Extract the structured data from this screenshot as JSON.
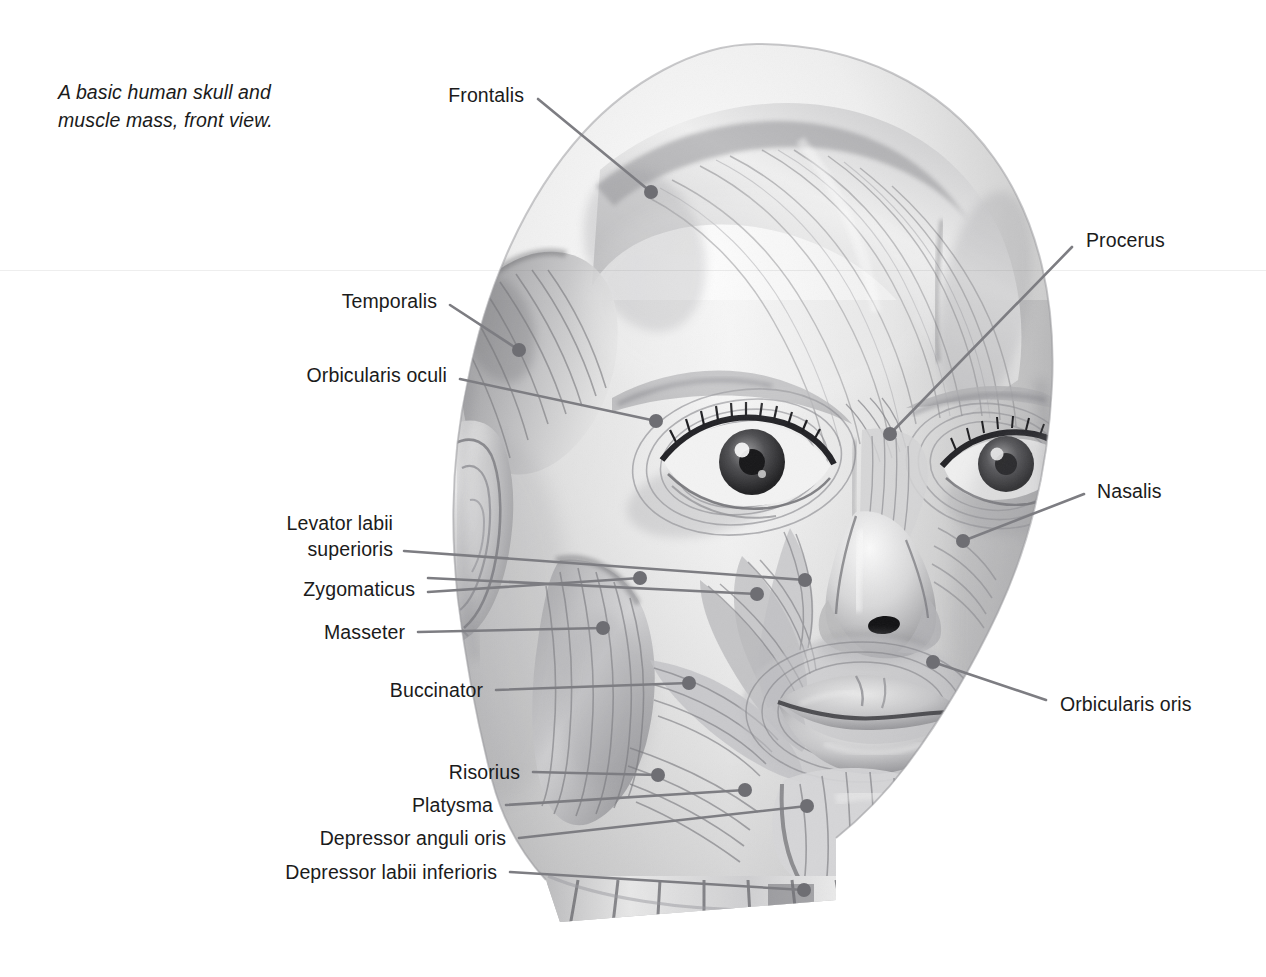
{
  "figure": {
    "title": "A basic human skull and muscle mass, front view.",
    "caption_line1": "A basic human skull and",
    "caption_line2": "muscle mass, front view.",
    "view": "front view",
    "medium": "graphite pencil anatomical illustration",
    "background_color": "#ffffff",
    "text_color": "#1b1b1b",
    "leader_color": "#7d7d82",
    "dot_color": "#6e6e73"
  },
  "labels": [
    {
      "id": "frontalis",
      "text": "Frontalis",
      "side": "left",
      "tx": 524,
      "ty": 95,
      "line": [
        [
          538,
          99
        ],
        [
          651,
          192
        ]
      ],
      "dot": [
        651,
        192
      ]
    },
    {
      "id": "temporalis",
      "text": "Temporalis",
      "side": "left",
      "tx": 437,
      "ty": 301,
      "line": [
        [
          450,
          305
        ],
        [
          519,
          350
        ]
      ],
      "dot": [
        519,
        350
      ]
    },
    {
      "id": "orbicularis-oculi",
      "text": "Orbicularis oculi",
      "side": "left",
      "tx": 447,
      "ty": 375,
      "line": [
        [
          460,
          379
        ],
        [
          656,
          421
        ]
      ],
      "dot": [
        656,
        421
      ]
    },
    {
      "id": "levator-labii-superioris",
      "text": "Levator labii superioris",
      "side": "left",
      "tx": 393,
      "ty": 536,
      "multiline": true,
      "line1": "Levator labii",
      "line2": "superioris",
      "line": [
        [
          404,
          551
        ],
        [
          805,
          580
        ]
      ],
      "dot": [
        805,
        580
      ]
    },
    {
      "id": "zygomaticus",
      "text": "Zygomaticus",
      "side": "left",
      "tx": 415,
      "ty": 589,
      "line": [
        [
          428,
          578
        ],
        [
          757,
          594
        ]
      ],
      "dot": [
        757,
        594
      ],
      "line_b": [
        [
          428,
          592
        ],
        [
          640,
          578
        ]
      ],
      "dot_b": [
        640,
        578
      ]
    },
    {
      "id": "masseter",
      "text": "Masseter",
      "side": "left",
      "tx": 405,
      "ty": 632,
      "line": [
        [
          418,
          632
        ],
        [
          603,
          628
        ]
      ],
      "dot": [
        603,
        628
      ]
    },
    {
      "id": "buccinator",
      "text": "Buccinator",
      "side": "left",
      "tx": 483,
      "ty": 690,
      "line": [
        [
          496,
          690
        ],
        [
          689,
          683
        ]
      ],
      "dot": [
        689,
        683
      ]
    },
    {
      "id": "risorius",
      "text": "Risorius",
      "side": "left",
      "tx": 520,
      "ty": 772,
      "line": [
        [
          533,
          772
        ],
        [
          658,
          775
        ]
      ],
      "dot": [
        658,
        775
      ]
    },
    {
      "id": "platysma",
      "text": "Platysma",
      "side": "left",
      "tx": 493,
      "ty": 805,
      "line": [
        [
          506,
          805
        ],
        [
          745,
          790
        ]
      ],
      "dot": [
        745,
        790
      ]
    },
    {
      "id": "depressor-anguli-oris",
      "text": "Depressor anguli oris",
      "side": "left",
      "tx": 506,
      "ty": 838,
      "line": [
        [
          519,
          838
        ],
        [
          807,
          806
        ]
      ],
      "dot": [
        807,
        806
      ]
    },
    {
      "id": "depressor-labii-inferioris",
      "text": "Depressor labii inferioris",
      "side": "left",
      "tx": 497,
      "ty": 872,
      "line": [
        [
          510,
          872
        ],
        [
          804,
          890
        ]
      ],
      "dot": [
        804,
        890
      ]
    },
    {
      "id": "procerus",
      "text": "Procerus",
      "side": "right",
      "tx": 1086,
      "ty": 240,
      "line": [
        [
          1072,
          247
        ],
        [
          890,
          434
        ]
      ],
      "dot": [
        890,
        434
      ]
    },
    {
      "id": "nasalis",
      "text": "Nasalis",
      "side": "right",
      "tx": 1097,
      "ty": 491,
      "line": [
        [
          1084,
          494
        ],
        [
          963,
          541
        ]
      ],
      "dot": [
        963,
        541
      ]
    },
    {
      "id": "orbicularis-oris",
      "text": "Orbicularis oris",
      "side": "right",
      "tx": 1060,
      "ty": 704,
      "line": [
        [
          1046,
          700
        ],
        [
          933,
          662
        ]
      ],
      "dot": [
        933,
        662
      ]
    }
  ],
  "anatomy_regions": [
    "cranium",
    "frontalis",
    "temporalis",
    "orbicularis oculi",
    "procerus",
    "nasalis",
    "levator labii superioris",
    "zygomaticus",
    "masseter",
    "buccinator",
    "orbicularis oris",
    "risorius",
    "platysma",
    "depressor anguli oris",
    "depressor labii inferioris",
    "ear",
    "neck"
  ]
}
